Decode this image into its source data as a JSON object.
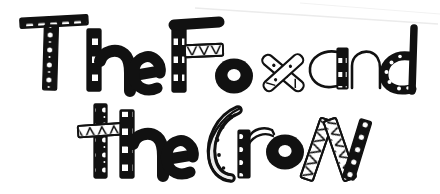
{
  "artwork": {
    "kind": "hand-drawn-decorative-title",
    "medium": "black-ink-doodle-lettering",
    "background_color": "#ffffff",
    "ink_color": "#111111",
    "full_text": "The Fox and the Crow",
    "canvas": {
      "width": 440,
      "height": 194
    }
  },
  "lines": [
    {
      "id": "line-1",
      "text": "The Fox and",
      "words": [
        "The",
        "Fox",
        "and"
      ]
    },
    {
      "id": "line-2",
      "text": "the Crow",
      "words": [
        "the",
        "Crow"
      ]
    }
  ],
  "letters": [
    {
      "id": "letter-T-cap",
      "char": "T",
      "line": 1,
      "word": "The",
      "pattern": "white-dashes-and-dots-on-black"
    },
    {
      "id": "letter-h-1",
      "char": "h",
      "line": 1,
      "word": "The",
      "pattern": "checkerboard-stem-solid-arch"
    },
    {
      "id": "letter-e-1",
      "char": "e",
      "line": 1,
      "word": "The",
      "pattern": "solid-black"
    },
    {
      "id": "letter-F-cap",
      "char": "F",
      "line": 1,
      "word": "Fox",
      "pattern": "checkerboard-stem-zigzag-crossbar"
    },
    {
      "id": "letter-o-1",
      "char": "o",
      "line": 1,
      "word": "Fox",
      "pattern": "solid-black-ring"
    },
    {
      "id": "letter-x-1",
      "char": "x",
      "line": 1,
      "word": "Fox",
      "pattern": "outlined-crossed-strokes"
    },
    {
      "id": "letter-a-1",
      "char": "a",
      "line": 1,
      "word": "and",
      "pattern": "outlined-bowl-checkerboard-stem"
    },
    {
      "id": "letter-n-1",
      "char": "n",
      "line": 1,
      "word": "and",
      "pattern": "outlined-arch"
    },
    {
      "id": "letter-d-1",
      "char": "d",
      "line": 1,
      "word": "and",
      "pattern": "dotted-bowl-solid-stem"
    },
    {
      "id": "letter-t-low",
      "char": "t",
      "line": 2,
      "word": "the",
      "pattern": "dotted-stem-zigzag-crossbar"
    },
    {
      "id": "letter-h-2",
      "char": "h",
      "line": 2,
      "word": "the",
      "pattern": "checkerboard-stem-solid-arch"
    },
    {
      "id": "letter-e-2",
      "char": "e",
      "line": 2,
      "word": "the",
      "pattern": "solid-black"
    },
    {
      "id": "letter-C-cap",
      "char": "C",
      "line": 2,
      "word": "Crow",
      "pattern": "outlined-crescent-with-dots"
    },
    {
      "id": "letter-r-1",
      "char": "r",
      "line": 2,
      "word": "Crow",
      "pattern": "dotted-stem-outlined-arm"
    },
    {
      "id": "letter-o-2",
      "char": "o",
      "line": 2,
      "word": "Crow",
      "pattern": "solid-black-ring"
    },
    {
      "id": "letter-W-cap",
      "char": "W",
      "line": 2,
      "word": "Crow",
      "pattern": "zigzag-and-dotted-strokes"
    }
  ],
  "artifacts": [
    {
      "id": "scan-streak",
      "description": "faint diagonal scan line across upper right",
      "color": "#e8e8e8"
    }
  ]
}
